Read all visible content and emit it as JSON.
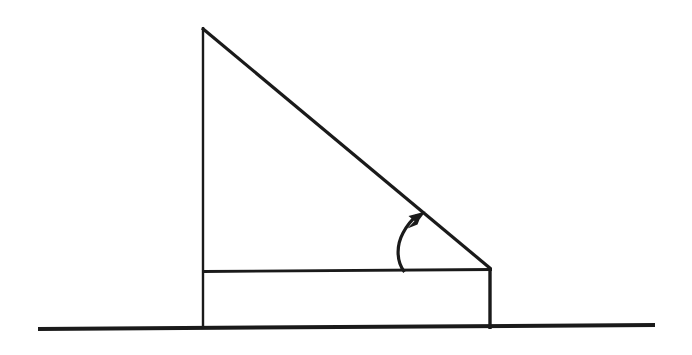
{
  "figure": {
    "background_color": "#ffffff",
    "ink_color": "#1a1a1a",
    "canvas": {
      "width": 692,
      "height": 355
    },
    "elements": {
      "ground_line": {
        "name": "ground-line",
        "x1": 38,
        "y1": 329,
        "x2": 655,
        "y2": 325,
        "stroke_width": 4
      },
      "left_vertical": {
        "name": "wedge-left-vertical-edge",
        "x1": 203,
        "y1": 27,
        "x2": 203,
        "y2": 329,
        "stroke_width": 2.4
      },
      "right_vertical": {
        "name": "wedge-right-vertical-edge",
        "x1": 490,
        "y1": 268,
        "x2": 490,
        "y2": 329,
        "stroke_width": 3.4
      },
      "hypotenuse": {
        "name": "wedge-hypotenuse-incline",
        "x1": 202,
        "y1": 28,
        "x2": 491,
        "y2": 269,
        "stroke_width": 3.2
      },
      "base_horizontal": {
        "name": "wedge-base-horizontal-line",
        "x1": 203,
        "y1": 271,
        "x2": 492,
        "y2": 269,
        "stroke_width": 2.8
      },
      "angle_arrow": {
        "name": "angle-indicator-arrow",
        "path": "M 404.5,272 C 396.5,262 396,246 403,233 C 407.5,224.5 412,219.5 417,215.5",
        "stroke_width": 3.2,
        "arrowhead_points": "425,212.5 410.5,216.5 415.5,220.5 409,227.5 418,224 418.5,220.5",
        "tip_x": 425,
        "tip_y": 212.5,
        "tail_x": 404.5,
        "tail_y": 272
      }
    }
  }
}
